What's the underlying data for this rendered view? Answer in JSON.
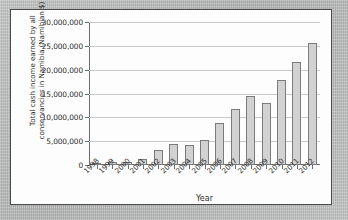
{
  "chart_data": {
    "type": "bar",
    "title": "",
    "xlabel": "Year",
    "ylabel": "Total cash income earned by all\nconservancies in Namibia (Namibian $)",
    "categories": [
      "1998",
      "1999",
      "2000",
      "2001",
      "2002",
      "2003",
      "2004",
      "2005",
      "2006",
      "2007",
      "2008",
      "2009",
      "2010",
      "2011",
      "2012"
    ],
    "values": [
      300000,
      600000,
      650000,
      1300000,
      3200000,
      4400000,
      4200000,
      5200000,
      8900000,
      11800000,
      14500000,
      13100000,
      17800000,
      21600000,
      25500000
    ],
    "ylim": [
      0,
      30000000
    ],
    "ytick_values": [
      0,
      5000000,
      10000000,
      15000000,
      20000000,
      25000000,
      30000000
    ],
    "ytick_labels": [
      "0",
      "5,000,000",
      "10,000,000",
      "15,000,000",
      "20,000,000",
      "25,000,000",
      "30,000,000"
    ],
    "grid": true,
    "legend": "none",
    "colors": {
      "bar_fill": "#d2d2d2",
      "bar_edge": "#7b7b7b",
      "gridline": "#c9c9c9",
      "axis": "#6d6d6d",
      "text": "#2d2d2d",
      "panel_background": "#fdfdfd",
      "panel_border": "#4a4a4a",
      "page_background": "#b8bbba"
    }
  }
}
